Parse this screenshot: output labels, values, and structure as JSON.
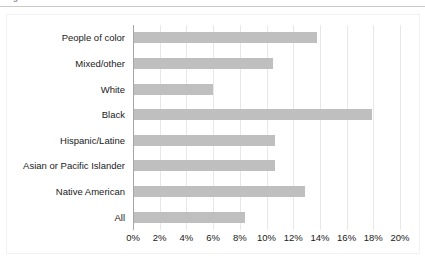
{
  "caption": {
    "clipped_text": "Figure"
  },
  "chart_data": {
    "type": "bar",
    "orientation": "horizontal",
    "title": "",
    "subtitle": "",
    "xlabel": "",
    "ylabel": "",
    "xlim": [
      0,
      20
    ],
    "xtick_labels": [
      "0%",
      "2%",
      "4%",
      "6%",
      "8%",
      "10%",
      "12%",
      "14%",
      "16%",
      "18%",
      "20%"
    ],
    "xtick_values": [
      0,
      2,
      4,
      6,
      8,
      10,
      12,
      14,
      16,
      18,
      20
    ],
    "grid": true,
    "grid_axis": "x",
    "legend": false,
    "bar_color": "#bfbfbf",
    "axis_color": "#a6a6a6",
    "gridline_color": "#e8e8e8",
    "text_color": "#1a1a1a",
    "categories": [
      "People of color",
      "Mixed/other",
      "White",
      "Black",
      "Hispanic/Latine",
      "Asian or Pacific Islander",
      "Native American",
      "All"
    ],
    "values": [
      13.8,
      10.5,
      6.0,
      17.9,
      10.6,
      10.6,
      12.9,
      8.4
    ],
    "value_labels": [
      "13.8%",
      "10.5%",
      "6.0%",
      "17.9%",
      "10.6%",
      "10.6%",
      "12.9%",
      "8.4%"
    ],
    "value_labels_visible": false
  }
}
